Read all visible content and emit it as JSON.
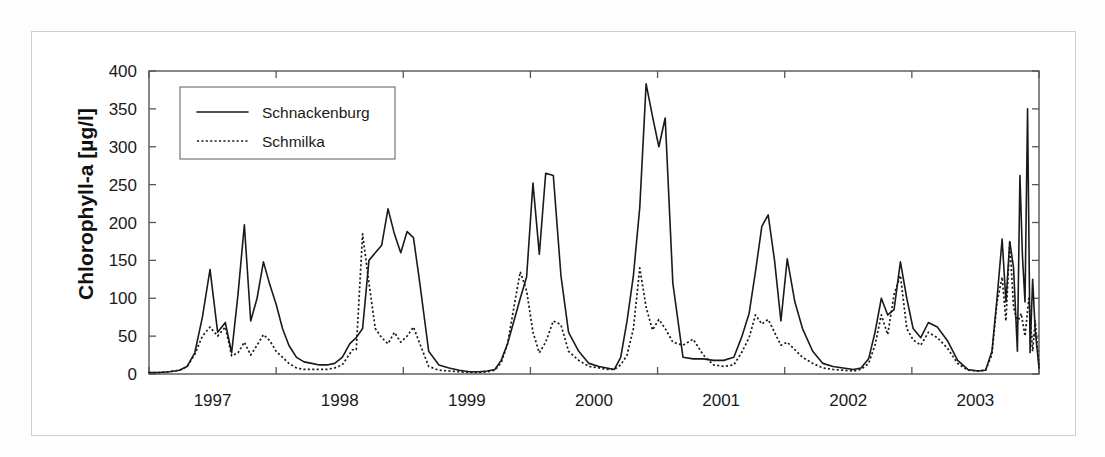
{
  "figure": {
    "background_color": "#ffffff",
    "frame_color": "#cfcfcf",
    "axis_color": "#555555",
    "line_color": "#1a1a1a"
  },
  "chart_data": {
    "type": "line",
    "title": "",
    "xlabel": "",
    "ylabel": "Chlorophyll-a [µg/l]",
    "ylim": [
      0,
      400
    ],
    "yticks": [
      0,
      50,
      100,
      150,
      200,
      250,
      300,
      350,
      400
    ],
    "ytick_labels": [
      "0",
      "50",
      "100",
      "150",
      "200",
      "250",
      "300",
      "350",
      "400"
    ],
    "xlim": [
      1996.5,
      2003.5
    ],
    "xticks": [
      1996.5,
      1997.5,
      1998.5,
      1999.5,
      2000.5,
      2001.5,
      2002.5,
      2003.5
    ],
    "xtick_labels": [
      "1997",
      "1998",
      "1999",
      "2000",
      "2001",
      "2002",
      "2003"
    ],
    "xtick_label_positions": [
      1997.0,
      1998.0,
      1999.0,
      2000.0,
      2001.0,
      2002.0,
      2003.0
    ],
    "grid": false,
    "legend_position": "upper left",
    "legend": [
      {
        "label": "Schnackenburg",
        "style": "solid"
      },
      {
        "label": "Schmilka",
        "style": "dotted"
      }
    ],
    "series": [
      {
        "name": "Schnackenburg",
        "style": "solid",
        "x": [
          1996.5,
          1996.58,
          1996.66,
          1996.74,
          1996.8,
          1996.86,
          1996.92,
          1996.98,
          1997.04,
          1997.1,
          1997.15,
          1997.2,
          1997.25,
          1997.3,
          1997.35,
          1997.4,
          1997.45,
          1997.5,
          1997.55,
          1997.6,
          1997.66,
          1997.72,
          1997.78,
          1997.84,
          1997.9,
          1997.96,
          1998.02,
          1998.08,
          1998.13,
          1998.18,
          1998.23,
          1998.28,
          1998.33,
          1998.38,
          1998.43,
          1998.48,
          1998.53,
          1998.58,
          1998.63,
          1998.7,
          1998.78,
          1998.86,
          1998.94,
          1999.02,
          1999.1,
          1999.16,
          1999.22,
          1999.27,
          1999.32,
          1999.37,
          1999.42,
          1999.47,
          1999.52,
          1999.57,
          1999.62,
          1999.68,
          1999.74,
          1999.8,
          1999.88,
          1999.96,
          2000.04,
          2000.1,
          2000.16,
          2000.21,
          2000.26,
          2000.31,
          2000.36,
          2000.41,
          2000.46,
          2000.51,
          2000.56,
          2000.62,
          2000.7,
          2000.78,
          2000.86,
          2000.94,
          2001.02,
          2001.1,
          2001.16,
          2001.22,
          2001.27,
          2001.32,
          2001.37,
          2001.42,
          2001.47,
          2001.52,
          2001.58,
          2001.64,
          2001.72,
          2001.8,
          2001.88,
          2001.96,
          2002.04,
          2002.1,
          2002.16,
          2002.21,
          2002.26,
          2002.31,
          2002.36,
          2002.41,
          2002.46,
          2002.51,
          2002.57,
          2002.63,
          2002.7,
          2002.78,
          2002.86,
          2002.94,
          2003.02,
          2003.08,
          2003.13,
          2003.17,
          2003.21,
          2003.24,
          2003.27,
          2003.3,
          2003.33,
          2003.35,
          2003.37,
          2003.39,
          2003.41,
          2003.43,
          2003.45,
          2003.47,
          2003.5
        ],
        "y": [
          2,
          2,
          3,
          5,
          10,
          28,
          75,
          138,
          55,
          68,
          28,
          105,
          197,
          70,
          100,
          148,
          118,
          92,
          60,
          38,
          22,
          16,
          14,
          12,
          12,
          14,
          22,
          40,
          48,
          60,
          150,
          160,
          170,
          218,
          185,
          160,
          188,
          180,
          120,
          30,
          12,
          8,
          5,
          3,
          3,
          4,
          6,
          18,
          40,
          70,
          100,
          128,
          252,
          158,
          265,
          262,
          130,
          55,
          30,
          14,
          10,
          8,
          6,
          22,
          70,
          130,
          220,
          383,
          340,
          300,
          338,
          120,
          22,
          20,
          20,
          18,
          18,
          22,
          48,
          80,
          135,
          195,
          210,
          150,
          70,
          152,
          95,
          60,
          30,
          14,
          10,
          8,
          6,
          8,
          20,
          55,
          100,
          78,
          85,
          148,
          100,
          60,
          48,
          68,
          62,
          44,
          18,
          6,
          4,
          5,
          30,
          100,
          178,
          95,
          175,
          140,
          30,
          262,
          155,
          95,
          350,
          28,
          125,
          58,
          8
        ]
      },
      {
        "name": "Schmilka",
        "style": "dotted",
        "x": [
          1996.5,
          1996.58,
          1996.66,
          1996.74,
          1996.8,
          1996.86,
          1996.92,
          1996.98,
          1997.04,
          1997.1,
          1997.15,
          1997.2,
          1997.25,
          1997.3,
          1997.35,
          1997.4,
          1997.45,
          1997.5,
          1997.55,
          1997.6,
          1997.66,
          1997.72,
          1997.78,
          1997.84,
          1997.9,
          1997.96,
          1998.02,
          1998.06,
          1998.1,
          1998.13,
          1998.18,
          1998.23,
          1998.28,
          1998.33,
          1998.38,
          1998.43,
          1998.48,
          1998.53,
          1998.58,
          1998.63,
          1998.7,
          1998.78,
          1998.86,
          1998.94,
          1999.02,
          1999.1,
          1999.16,
          1999.22,
          1999.27,
          1999.32,
          1999.37,
          1999.42,
          1999.47,
          1999.52,
          1999.57,
          1999.62,
          1999.68,
          1999.74,
          1999.8,
          1999.88,
          1999.96,
          2000.04,
          2000.1,
          2000.16,
          2000.21,
          2000.26,
          2000.31,
          2000.36,
          2000.41,
          2000.46,
          2000.51,
          2000.56,
          2000.62,
          2000.7,
          2000.78,
          2000.86,
          2000.94,
          2001.02,
          2001.1,
          2001.16,
          2001.22,
          2001.27,
          2001.32,
          2001.37,
          2001.42,
          2001.47,
          2001.52,
          2001.58,
          2001.64,
          2001.72,
          2001.8,
          2001.88,
          2001.96,
          2002.04,
          2002.1,
          2002.16,
          2002.21,
          2002.26,
          2002.31,
          2002.36,
          2002.41,
          2002.46,
          2002.51,
          2002.57,
          2002.63,
          2002.7,
          2002.78,
          2002.86,
          2002.94,
          2003.02,
          2003.08,
          2003.13,
          2003.17,
          2003.21,
          2003.24,
          2003.27,
          2003.3,
          2003.33,
          2003.36,
          2003.39,
          2003.42,
          2003.45,
          2003.47,
          2003.5
        ],
        "y": [
          2,
          2,
          3,
          5,
          10,
          26,
          50,
          62,
          50,
          62,
          24,
          28,
          42,
          25,
          38,
          52,
          44,
          30,
          22,
          14,
          8,
          6,
          6,
          6,
          6,
          8,
          12,
          22,
          32,
          32,
          185,
          120,
          60,
          48,
          40,
          55,
          42,
          50,
          62,
          40,
          10,
          5,
          4,
          3,
          2,
          2,
          3,
          5,
          15,
          40,
          88,
          135,
          110,
          55,
          28,
          42,
          70,
          65,
          30,
          18,
          10,
          8,
          6,
          6,
          12,
          25,
          60,
          140,
          88,
          58,
          72,
          60,
          42,
          38,
          46,
          25,
          12,
          10,
          12,
          28,
          48,
          78,
          66,
          72,
          55,
          38,
          42,
          32,
          22,
          14,
          8,
          6,
          5,
          4,
          6,
          14,
          38,
          78,
          52,
          105,
          130,
          60,
          45,
          38,
          55,
          48,
          34,
          14,
          5,
          4,
          5,
          26,
          95,
          128,
          70,
          175,
          88,
          68,
          80,
          50,
          100,
          30,
          70,
          12
        ]
      }
    ]
  }
}
